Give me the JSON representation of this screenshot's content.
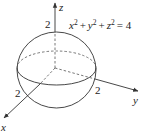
{
  "figure": {
    "equation": {
      "x_term": "x",
      "y_term": "y",
      "z_term": "z",
      "exp": "2",
      "plus": "+",
      "equals": "= 4"
    },
    "axes": {
      "x_label": "x",
      "y_label": "y",
      "z_label": "z"
    },
    "intercepts": {
      "x": "2",
      "y": "2",
      "z": "2"
    },
    "colors": {
      "stroke": "#333333",
      "background": "#ffffff"
    }
  }
}
